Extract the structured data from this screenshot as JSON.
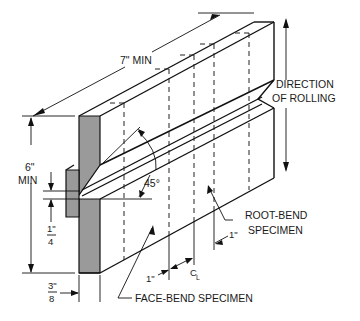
{
  "diagram": {
    "colors": {
      "line": "#111111",
      "shade": "#9a9a9a",
      "background": "#ffffff"
    },
    "labels": {
      "length": "7\" MIN",
      "height_value": "6\"",
      "height_unit": "MIN",
      "direction_line1": "DIRECTION",
      "direction_line2": "OF ROLLING",
      "angle": "45°",
      "quarter_num": "1\"",
      "quarter_den": "4",
      "three_eighths_num": "3\"",
      "three_eighths_den": "8",
      "root_bend_line1": "ROOT-BEND",
      "root_bend_line2": "SPECIMEN",
      "face_bend": "FACE-BEND SPECIMEN",
      "one_inch_left": "1\"",
      "one_inch_right": "1\"",
      "centerline": "C",
      "centerline_sub": "L"
    }
  }
}
